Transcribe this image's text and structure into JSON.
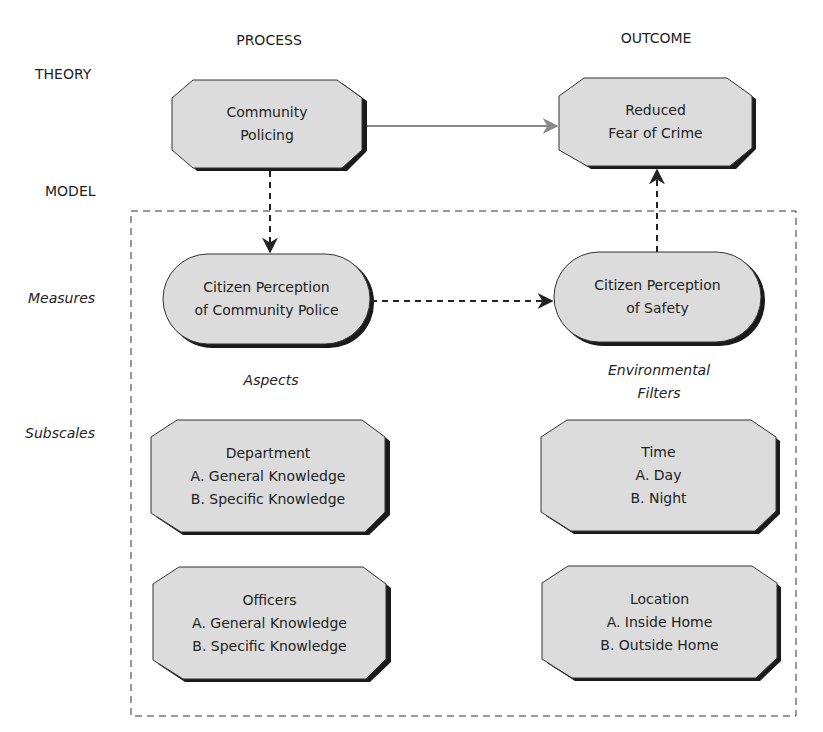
{
  "columns": {
    "process": "PROCESS",
    "outcome": "OUTCOME"
  },
  "rows": {
    "theory": "THEORY",
    "model": "MODEL",
    "measures": "Measures",
    "subscales": "Subscales"
  },
  "annotations": {
    "aspects": "Aspects",
    "env_line1": "Environmental",
    "env_line2": "Filters"
  },
  "nodes": {
    "community_policing": {
      "lines": [
        "Community",
        "Policing"
      ]
    },
    "reduced_fear": {
      "lines": [
        "Reduced",
        "Fear of Crime"
      ]
    },
    "perception_police": {
      "lines": [
        "Citizen Perception",
        "of Community Police"
      ]
    },
    "perception_safety": {
      "lines": [
        "Citizen Perception",
        "of Safety"
      ]
    },
    "department": {
      "lines": [
        "Department",
        "A. General Knowledge",
        "B. Specific Knowledge"
      ]
    },
    "time": {
      "lines": [
        "Time",
        "A. Day",
        "B. Night"
      ]
    },
    "officers": {
      "lines": [
        "Officers",
        "A. General Knowledge",
        "B. Specific Knowledge"
      ]
    },
    "location": {
      "lines": [
        "Location",
        "A. Inside Home",
        "B. Outside Home"
      ]
    }
  },
  "colors": {
    "node_fill": "#dcdcdc",
    "node_stroke": "#333333",
    "shadow": "#1a1a1a",
    "solid_arrow": "#888888",
    "dashed": "#222222"
  }
}
